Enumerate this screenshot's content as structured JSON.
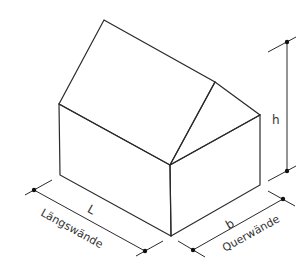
{
  "diagram": {
    "labels": {
      "length": "L",
      "width": "b",
      "height": "h",
      "long_walls": "Längswände",
      "cross_walls": "Querwände"
    },
    "colors": {
      "line": "#2a2a2a",
      "background": "#ffffff"
    }
  }
}
